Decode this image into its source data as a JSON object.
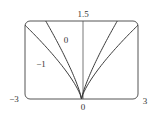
{
  "chart_data": {
    "type": "line",
    "title": "",
    "xlabel": "",
    "ylabel": "",
    "xlim": [
      -3,
      3
    ],
    "ylim": [
      0,
      1.5
    ],
    "tick_labels": {
      "x_min": "−3",
      "x_max": "3",
      "x_origin": "0",
      "y_max": "1.5"
    },
    "series": [
      {
        "name": "-1",
        "label": "−1",
        "side": "left",
        "x_at_top": -3.0,
        "y_at_edge": 1.42,
        "shape_exponent": 0.75
      },
      {
        "name": "0",
        "label": "0",
        "side": "left",
        "x_at_top": -1.9,
        "y_at_edge": 1.5,
        "shape_exponent": 0.8
      },
      {
        "name": "0-right",
        "label": "",
        "side": "right",
        "x_at_top": 1.9,
        "y_at_edge": 1.5,
        "shape_exponent": 0.8
      },
      {
        "name": "-1-right",
        "label": "",
        "side": "right",
        "x_at_top": 3.0,
        "y_at_edge": 1.42,
        "shape_exponent": 0.75
      }
    ],
    "grid": false,
    "legend": "none"
  }
}
